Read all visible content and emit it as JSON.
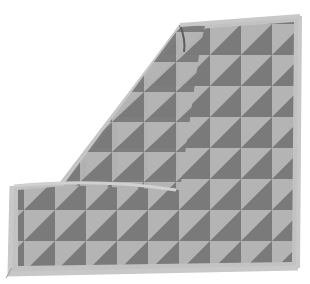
{
  "image": {
    "subject": "knitted blanket with half-square triangle pattern, one corner folded over",
    "background_color": "#ffffff",
    "colors": {
      "dark": "#7a7a7a",
      "light": "#b4b4b4",
      "border": "#c2c2c2",
      "fold_shadow": "#5c5c5c"
    },
    "grid": {
      "cols": 7,
      "rows": 6
    }
  }
}
